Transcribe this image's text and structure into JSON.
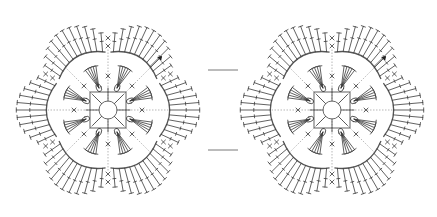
{
  "caption": "........",
  "diagram": {
    "stroke_color": "#3a3a3a",
    "guide_color": "#9a9a9a",
    "background": "#ffffff",
    "motifs": [
      {
        "id": "left",
        "cx": 108,
        "cy": 110
      },
      {
        "id": "right",
        "cx": 332,
        "cy": 110
      }
    ],
    "motif": {
      "petals": 6,
      "center_ring_radius": 9,
      "inner_square_half": 18,
      "inner_petal_groups": 8,
      "petal_arc_radius": 58,
      "outer_radius": 98,
      "stitches_per_petal": 11,
      "start_marker_angle_deg": -45
    },
    "joins": [
      {
        "x1": 208,
        "y1": 70,
        "x2": 238,
        "y2": 70
      },
      {
        "x1": 208,
        "y1": 150,
        "x2": 238,
        "y2": 150
      }
    ]
  }
}
